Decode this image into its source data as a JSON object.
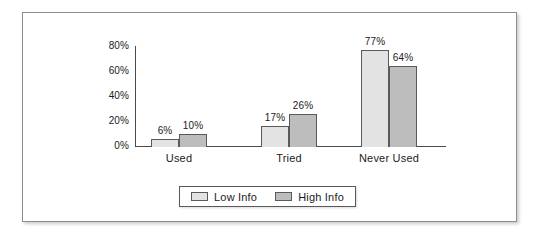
{
  "chart_data": {
    "type": "bar",
    "title": "",
    "subtitle": "",
    "xlabel": "",
    "ylabel": "",
    "categories": [
      "Used",
      "Tried",
      "Never Used"
    ],
    "series": [
      {
        "name": "Low Info",
        "values": [
          6,
          17,
          77
        ],
        "color": "#e3e3e3"
      },
      {
        "name": "High Info",
        "values": [
          10,
          26,
          64
        ],
        "color": "#bdbdbd"
      }
    ],
    "data_labels": [
      [
        "6%",
        "10%"
      ],
      [
        "17%",
        "26%"
      ],
      [
        "77%",
        "64%"
      ]
    ],
    "ylim": [
      0,
      80
    ],
    "yticks": [
      0,
      20,
      40,
      60,
      80
    ],
    "ytick_labels": [
      "0%",
      "20%",
      "40%",
      "60%",
      "80%"
    ],
    "grid": false,
    "legend_position": "bottom-center",
    "legend_entries": [
      "Low Info",
      "High Info"
    ]
  },
  "legend": {
    "items": [
      {
        "label": "Low Info",
        "swatch": "low-info-swatch"
      },
      {
        "label": "High Info",
        "swatch": "high-info-swatch"
      }
    ]
  },
  "axis": {
    "y_tick_labels": [
      "80%",
      "60%",
      "40%",
      "20%",
      "0%"
    ]
  },
  "colors": {
    "low_info": "#e3e3e3",
    "high_info": "#bdbdbd",
    "bar_stroke": "#5a5a5a",
    "axis": "#4a4a4a",
    "frame": "#8d8d8d",
    "text": "#1b1b1b",
    "background": "#ffffff"
  }
}
